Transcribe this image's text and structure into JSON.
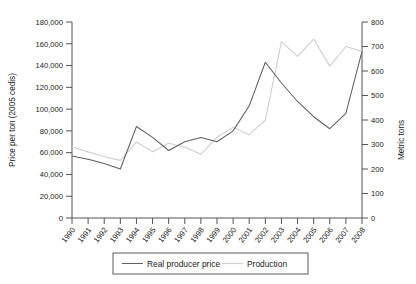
{
  "chart_data": {
    "type": "line",
    "title": "",
    "xlabel": "",
    "ylabel": "Price per ton (2005 cedis)",
    "y2label": "Metric tons",
    "grid": false,
    "legend_position": "bottom",
    "categories": [
      "1990",
      "1991",
      "1992",
      "1993",
      "1994",
      "1995",
      "1996",
      "1997",
      "1998",
      "1999",
      "2000",
      "2001",
      "2002",
      "2003",
      "2004",
      "2005",
      "2006",
      "2007",
      "2008"
    ],
    "ylim": [
      0,
      180000
    ],
    "y2lim": [
      0,
      800
    ],
    "yticks": [
      "0",
      "20,000",
      "40,000",
      "60,000",
      "80,000",
      "100,000",
      "120,000",
      "140,000",
      "160,000",
      "180,000"
    ],
    "ytick_values": [
      0,
      20000,
      40000,
      60000,
      80000,
      100000,
      120000,
      140000,
      160000,
      180000
    ],
    "y2ticks": [
      "0",
      "100",
      "200",
      "300",
      "400",
      "500",
      "600",
      "700",
      "800"
    ],
    "y2tick_values": [
      0,
      100,
      200,
      300,
      400,
      500,
      600,
      700,
      800
    ],
    "series": [
      {
        "name": "Real producer price",
        "axis": "left",
        "units": "2005 cedis per ton",
        "color": "#606060",
        "values": [
          57000,
          54000,
          50000,
          45000,
          84000,
          74000,
          62000,
          70000,
          74000,
          70000,
          80000,
          103000,
          143000,
          124000,
          107000,
          93000,
          82000,
          96000,
          153000
        ]
      },
      {
        "name": "Production",
        "axis": "right",
        "units": "Metric tons",
        "color": "#d0d0d0",
        "values": [
          290,
          270,
          250,
          235,
          310,
          270,
          305,
          290,
          260,
          330,
          370,
          340,
          400,
          720,
          660,
          730,
          620,
          700,
          680
        ]
      }
    ]
  },
  "legend": {
    "items": [
      {
        "label": "Real producer price"
      },
      {
        "label": "Production"
      }
    ]
  },
  "axes": {
    "left_title": "Price per ton (2005 cedis)",
    "right_title": "Metric tons"
  }
}
